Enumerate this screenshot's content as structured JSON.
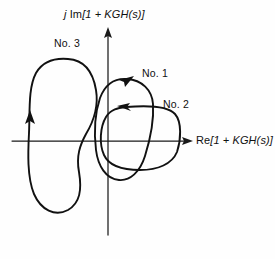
{
  "figure": {
    "background_color": "#fefefe",
    "ink_color": "#111111"
  },
  "axes": {
    "y_axis_label": "j Im[1 + KGH(s)]",
    "y_axis_label_parts": {
      "imaginary_unit": "j",
      "operator": "Im",
      "expression": "[1 + KGH(s)]"
    },
    "x_axis_label": "Re[1 + KGH(s)]",
    "x_axis_label_parts": {
      "operator": "Re",
      "expression": "[1 + KGH(s)]"
    },
    "origin": {
      "x": 108,
      "y": 141
    },
    "x_range_px": [
      12,
      190
    ],
    "y_range_px": [
      28,
      235
    ],
    "arrowheads": [
      "x-positive",
      "y-positive"
    ],
    "ticks": "none",
    "grid": "off"
  },
  "chart_data": {
    "type": "line",
    "title": "",
    "xlabel": "Re[1 + KGH(s)]",
    "ylabel": "j Im[1 + KGH(s)]",
    "grid": false,
    "legend": "inline-annotations",
    "series": [
      {
        "name": "No. 1",
        "label": "No. 1",
        "label_position": {
          "x": 142,
          "y": 68
        },
        "direction": "counterclockwise",
        "arrow_marker": {
          "x": 128,
          "y": 80,
          "points": "up-right"
        },
        "encircles_origin": true,
        "bbox_px": {
          "x_min": 95,
          "y_min": 78,
          "x_max": 156,
          "y_max": 181
        },
        "path": "M 127 79 C 142 80 152 90 153 104 C 154 120 150 140 145 156 C 140 172 130 181 119 180 C 106 179 98 166 96 150 C 94 133 95 113 100 98 C 105 85 114 78 127 79 Z"
      },
      {
        "name": "No. 2",
        "label": "No. 2",
        "label_position": {
          "x": 163,
          "y": 99
        },
        "direction": "counterclockwise",
        "arrow_marker": {
          "x": 125,
          "y": 107,
          "points": "left"
        },
        "encircles_origin": true,
        "bbox_px": {
          "x_min": 102,
          "y_min": 103,
          "x_max": 181,
          "y_max": 170
        },
        "path": "M 126 107 C 150 105 168 106 175 114 C 182 122 181 140 177 152 C 172 164 158 170 140 170 C 121 170 109 166 104 155 C 99 144 100 127 106 117 C 111 109 118 108 126 107 Z"
      },
      {
        "name": "No. 3",
        "label": "No. 3",
        "label_position": {
          "x": 54,
          "y": 38
        },
        "direction": "counterclockwise",
        "arrow_marker": {
          "x": 31,
          "y": 122,
          "points": "up"
        },
        "encircles_origin": false,
        "bbox_px": {
          "x_min": 28,
          "y_min": 58,
          "x_max": 99,
          "y_max": 214
        },
        "path": "M 68 59 C 84 60 93 72 96 90 C 99 108 92 124 86 134 C 80 145 76 156 79 172 C 82 190 80 203 68 210 C 55 217 41 210 34 194 C 27 177 28 152 29 133 C 30 112 28 88 36 73 C 43 61 56 58 68 59 Z"
      }
    ]
  },
  "labels": {
    "curves": [
      "No. 3",
      "No. 1",
      "No. 2"
    ]
  }
}
